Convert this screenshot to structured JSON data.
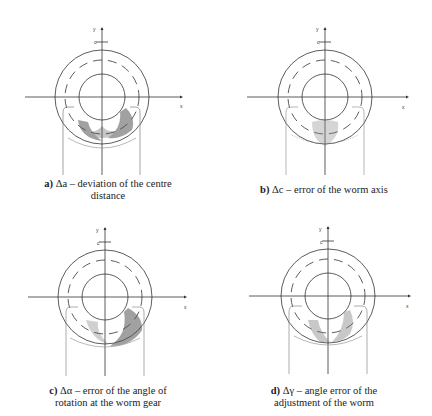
{
  "figure": {
    "panels": [
      {
        "id": "a",
        "letter": "a)",
        "caption_line1": "Δa – deviation of the centre",
        "caption_line2": "distance",
        "axis_labels": {
          "y": "y",
          "x": "x",
          "c": "c"
        },
        "contact_pattern": "two lobes at bottom flanks, heavy shading left and right, connected at center"
      },
      {
        "id": "b",
        "letter": "b)",
        "caption_line1": "Δc – error of the worm axis",
        "caption_line2": "",
        "axis_labels": {
          "y": "y",
          "x": "x",
          "c": "c"
        },
        "contact_pattern": "faint central patch below center"
      },
      {
        "id": "c",
        "letter": "c)",
        "caption_line1": "Δα – error of the angle of",
        "caption_line2": "rotation at the worm gear",
        "axis_labels": {
          "y": "y",
          "x": "x",
          "c": "c"
        },
        "contact_pattern": "shading concentrated lower right, lighter lower left"
      },
      {
        "id": "d",
        "letter": "d)",
        "caption_line1": "Δγ – angle error of the",
        "caption_line2": "adjustment of the worm",
        "axis_labels": {
          "y": "y",
          "x": "x",
          "c": "c"
        },
        "contact_pattern": "diagonal band from lower left to lower right"
      }
    ]
  }
}
